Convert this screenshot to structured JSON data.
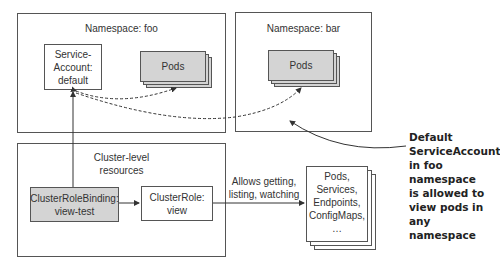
{
  "namespaces": {
    "foo": {
      "title": "Namespace: foo",
      "service_account": "Service-\nAccount:\ndefault",
      "pods": "Pods"
    },
    "bar": {
      "title": "Namespace: bar",
      "pods": "Pods"
    }
  },
  "cluster": {
    "title": "Cluster-level\nresources",
    "binding": "ClusterRoleBinding:\nview-test",
    "role": "ClusterRole:\nview"
  },
  "edge_label": "Allows getting,\nlisting, watching",
  "resources": "Pods,\nServices,\nEndpoints,\nConfigMaps,\n…",
  "annotation": "Default\nServiceAccount\nin foo namespace\nis allowed to\nview pods in\nany namespace",
  "colors": {
    "gray_fill": "#d4d4d4",
    "border": "#555555"
  }
}
